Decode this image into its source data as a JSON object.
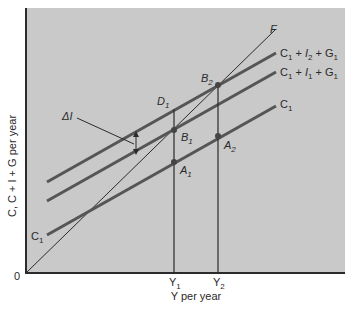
{
  "figure": {
    "y_axis_label": "C, C + I + G per year",
    "x_axis_label": "Y per year",
    "origin_label": "0",
    "x_ticks": [
      {
        "label": "Y",
        "sub": "1"
      },
      {
        "label": "Y",
        "sub": "2"
      }
    ],
    "lines": [
      {
        "id": "F",
        "label": "F"
      },
      {
        "id": "c_i2_g",
        "label_parts": [
          "C",
          "1",
          " + ",
          "I",
          "2",
          " + ",
          "G",
          "1"
        ]
      },
      {
        "id": "c_i1_g",
        "label_parts": [
          "C",
          "1",
          " + ",
          "I",
          "1",
          " + ",
          "G",
          "1"
        ]
      },
      {
        "id": "c1",
        "label_parts": [
          "C",
          "1"
        ]
      }
    ],
    "c1_left_label": {
      "main": "C",
      "sub": "1"
    },
    "points": [
      {
        "main": "D",
        "sub": "1"
      },
      {
        "main": "B",
        "sub": "1"
      },
      {
        "main": "A",
        "sub": "1"
      },
      {
        "main": "B",
        "sub": "2"
      },
      {
        "main": "A",
        "sub": "2"
      }
    ],
    "delta_label": "ΔI",
    "colors": {
      "plot_bg": "#c9c9c9",
      "thick_line": "#555555",
      "thin_line": "#2b2b2b",
      "text": "#2a2a2a"
    }
  }
}
